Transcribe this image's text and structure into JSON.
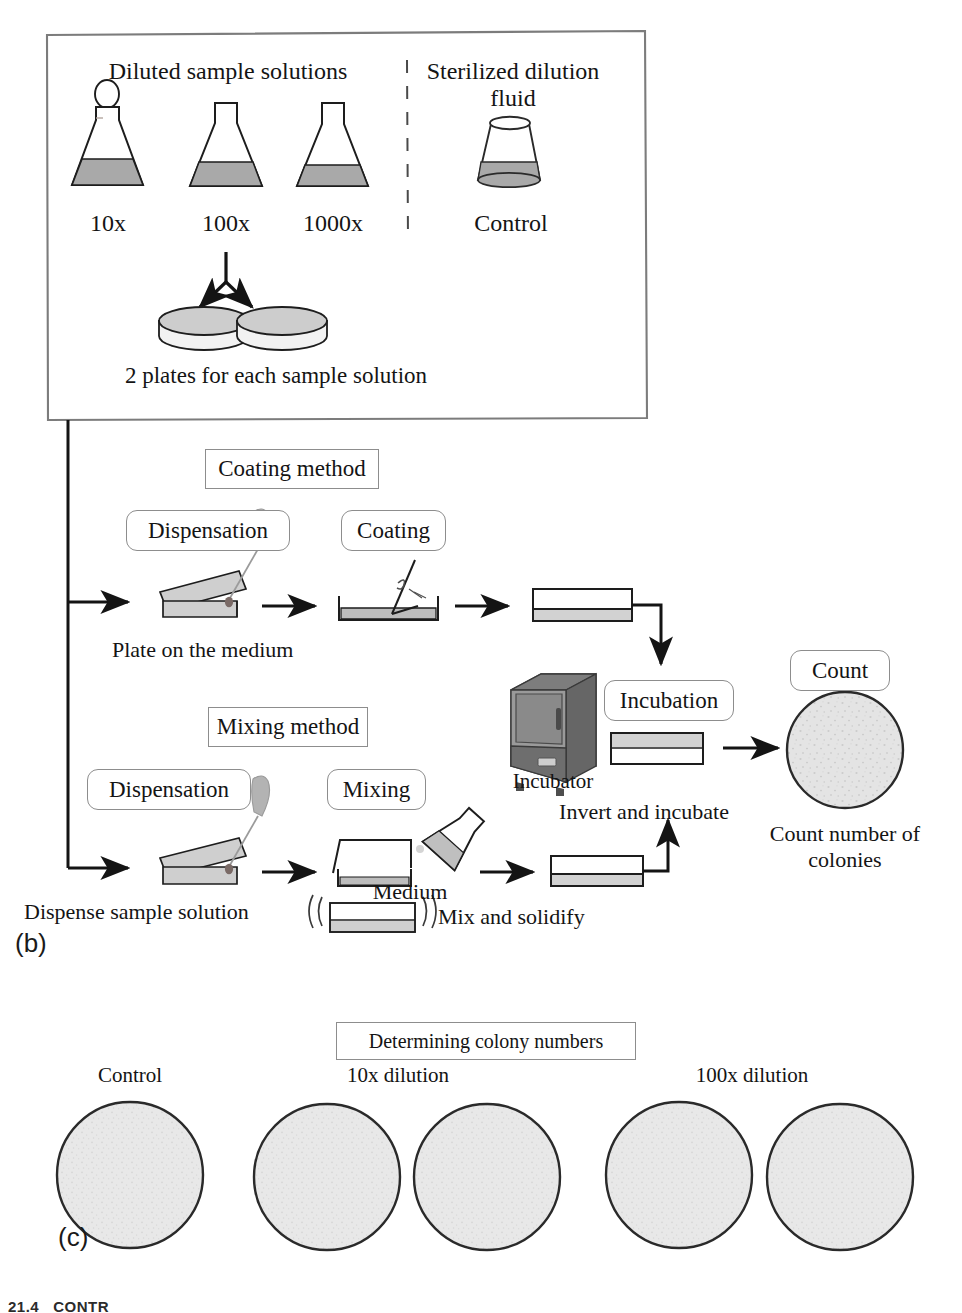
{
  "figure": {
    "panels": [
      {
        "id": "b",
        "label": "(b)"
      },
      {
        "id": "c",
        "label": "(c)"
      }
    ],
    "footer_text": "21.4   CONTR"
  },
  "panel_b": {
    "preparation_box": {
      "headings": {
        "diluted": "Diluted sample solutions",
        "sterilized_line1": "Sterilized dilution",
        "sterilized_line2": "fluid"
      },
      "flasks": [
        {
          "label": "10x",
          "has_stopper": true
        },
        {
          "label": "100x",
          "has_stopper": false
        },
        {
          "label": "1000x",
          "has_stopper": false
        }
      ],
      "control": {
        "label": "Control",
        "vessel": "beaker"
      },
      "plates_caption": "2 plates for each sample solution",
      "plate_count": 2
    },
    "coating_method": {
      "title": "Coating method",
      "steps": [
        {
          "label": "Dispensation",
          "caption": "Plate on the medium"
        },
        {
          "label": "Coating",
          "caption": ""
        }
      ]
    },
    "mixing_method": {
      "title": "Mixing method",
      "steps": [
        {
          "label": "Dispensation",
          "caption": "Dispense sample solution"
        },
        {
          "label": "Mixing",
          "caption": "Medium"
        }
      ],
      "mix_caption": "Mix and solidify"
    },
    "incubation": {
      "title": "Incubation",
      "device_label": "Incubator",
      "caption": "Invert and incubate"
    },
    "count": {
      "title": "Count",
      "caption_line1": "Count number of",
      "caption_line2": "colonies"
    }
  },
  "panel_c": {
    "title": "Determining colony numbers",
    "groups": [
      {
        "label": "Control",
        "plates": 1
      },
      {
        "label": "10x dilution",
        "plates": 2
      },
      {
        "label": "100x dilution",
        "plates": 2
      }
    ]
  },
  "colors": {
    "ink": "#141414",
    "line": "#1a1a1a",
    "box_border": "#8d8d8d",
    "fill_medium": "#a8a8a8",
    "fill_light": "#d8d8d8",
    "fill_plate": "#e2e2e2",
    "fill_agar": "#cfcfcf",
    "incubator_dark": "#6f6f6f",
    "incubator_mid": "#8f8f8f",
    "incubator_light": "#a5a5a5",
    "background": "#ffffff"
  }
}
